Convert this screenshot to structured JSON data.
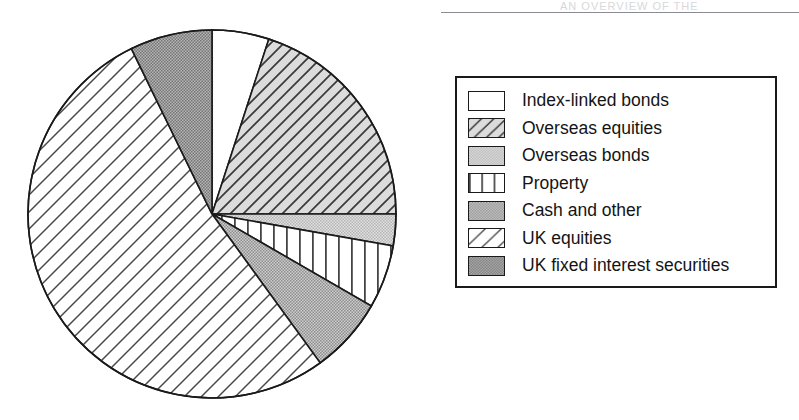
{
  "page": {
    "background_color": "#ffffff",
    "scan_artifact_text": "AN OVERVIEW OF THE",
    "rule_color": "#8b8b93"
  },
  "chart_data": {
    "type": "pie",
    "title": "",
    "legend_position": "right",
    "grid": false,
    "start_angle_deg": 0,
    "direction": "clockwise",
    "center": {
      "cx": 186,
      "cy": 186,
      "r": 184
    },
    "outline_color": "#1a1a1a",
    "categories": [
      "Index-linked bonds",
      "Overseas equities",
      "Overseas bonds",
      "Property",
      "Cash and other",
      "UK equities",
      "UK fixed interest securities"
    ],
    "values": [
      5.0,
      20.0,
      2.8,
      5.6,
      6.7,
      52.8,
      7.1
    ],
    "slices": [
      {
        "label": "Index-linked bonds",
        "value": 5.0,
        "start_deg": 0,
        "end_deg": 18,
        "fill": "solid-white",
        "fill_color": "#ffffff",
        "pattern_name": "blank"
      },
      {
        "label": "Overseas equities",
        "value": 20.0,
        "start_deg": 18,
        "end_deg": 90,
        "fill": "diagonal-hatch-dense",
        "fill_color": "#d3d3d3",
        "pattern_name": "diagonal-lines-backslash"
      },
      {
        "label": "Overseas bonds",
        "value": 2.8,
        "start_deg": 90,
        "end_deg": 100,
        "fill": "light-gray-stipple",
        "fill_color": "#c9c9c9",
        "pattern_name": "fine-dots-light"
      },
      {
        "label": "Property",
        "value": 5.6,
        "start_deg": 100,
        "end_deg": 120,
        "fill": "vertical-lines",
        "fill_color": "#ffffff",
        "pattern_name": "vertical-lines"
      },
      {
        "label": "Cash and other",
        "value": 6.7,
        "start_deg": 120,
        "end_deg": 144,
        "fill": "medium-gray-stipple",
        "fill_color": "#b0b0b0",
        "pattern_name": "fine-dots-medium"
      },
      {
        "label": "UK equities",
        "value": 52.8,
        "start_deg": 144,
        "end_deg": 334,
        "fill": "diagonal-hatch-sparse",
        "fill_color": "#ffffff",
        "pattern_name": "diagonal-lines-slash-wide"
      },
      {
        "label": "UK fixed interest securities",
        "value": 7.1,
        "start_deg": 334,
        "end_deg": 360,
        "fill": "dark-gray-stipple",
        "fill_color": "#9a9a9a",
        "pattern_name": "fine-dots-dark"
      }
    ]
  },
  "legend": {
    "border_color": "#1a1a1a",
    "items": [
      {
        "label": "Index-linked bonds",
        "pattern": "blank",
        "swatch_color": "#ffffff"
      },
      {
        "label": "Overseas equities",
        "pattern": "diagonal-lines-backslash",
        "swatch_color": "#d3d3d3"
      },
      {
        "label": "Overseas bonds",
        "pattern": "fine-dots-light",
        "swatch_color": "#c9c9c9"
      },
      {
        "label": "Property",
        "pattern": "vertical-lines",
        "swatch_color": "#ffffff"
      },
      {
        "label": "Cash and other",
        "pattern": "fine-dots-medium",
        "swatch_color": "#b0b0b0"
      },
      {
        "label": "UK equities",
        "pattern": "diagonal-lines-slash-wide",
        "swatch_color": "#ffffff"
      },
      {
        "label": "UK fixed interest securities",
        "pattern": "fine-dots-dark",
        "swatch_color": "#9a9a9a"
      }
    ]
  }
}
